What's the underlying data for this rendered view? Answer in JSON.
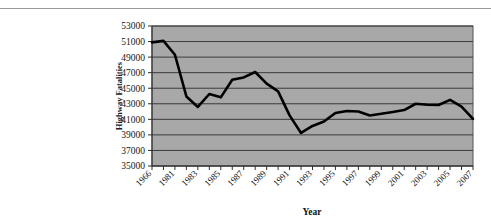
{
  "page": {
    "background_color": "#ffffff",
    "rule_color": "#9a9a9a"
  },
  "chart_data": {
    "type": "line",
    "title": "",
    "xlabel": "Year",
    "ylabel": "Highway Fatalities",
    "ylim": [
      35000,
      53000
    ],
    "ytick_step": 2000,
    "yticks": [
      "35000",
      "37000",
      "39000",
      "41000",
      "43000",
      "45000",
      "47000",
      "49000",
      "51000",
      "53000"
    ],
    "xticks": [
      "1966",
      "1981",
      "1983",
      "1985",
      "1987",
      "1989",
      "1991",
      "1993",
      "1995",
      "1997",
      "1999",
      "2001",
      "2003",
      "2005",
      "2007"
    ],
    "grid": true,
    "grid_orientation": "horizontal",
    "legend": false,
    "plot_background_color": "#a8a8a8",
    "line_color": "#000000",
    "line_width": 2.6,
    "x": [
      1966,
      1980,
      1981,
      1982,
      1983,
      1984,
      1985,
      1986,
      1987,
      1988,
      1989,
      1990,
      1991,
      1992,
      1993,
      1994,
      1995,
      1996,
      1997,
      1998,
      1999,
      2000,
      2001,
      2002,
      2003,
      2004,
      2005,
      2006,
      2007
    ],
    "values": [
      50894,
      51091,
      49301,
      43945,
      42589,
      44257,
      43825,
      46087,
      46390,
      47087,
      45582,
      44599,
      41508,
      39250,
      40150,
      40716,
      41817,
      42065,
      42013,
      41501,
      41717,
      41945,
      42196,
      43005,
      42884,
      42836,
      43510,
      42642,
      41059
    ],
    "values_note": "estimated from plotted line against gridlines",
    "series": [
      {
        "name": "Highway Fatalities",
        "values": [
          50894,
          51091,
          49301,
          43945,
          42589,
          44257,
          43825,
          46087,
          46390,
          47087,
          45582,
          44599,
          41508,
          39250,
          40150,
          40716,
          41817,
          42065,
          42013,
          41501,
          41717,
          41945,
          42196,
          43005,
          42884,
          42836,
          43510,
          42642,
          41059
        ]
      }
    ]
  }
}
